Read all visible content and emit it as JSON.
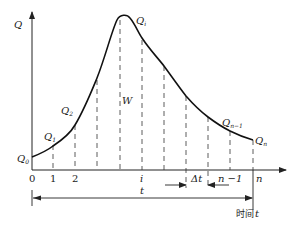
{
  "diagram": {
    "type": "hydrograph",
    "y_axis_label": "Q",
    "x_axis_time_label": "时间",
    "x_axis_time_var": "t",
    "area_label": "W",
    "interval_label": "Δt",
    "total_span_label": "t",
    "curve_labels": [
      {
        "base": "Q",
        "sub": "0"
      },
      {
        "base": "Q",
        "sub": "1"
      },
      {
        "base": "Q",
        "sub": "2"
      },
      {
        "base": "Q",
        "sub": "i"
      },
      {
        "base": "Q",
        "sub": "n−1"
      },
      {
        "base": "Q",
        "sub": "n"
      }
    ],
    "x_ticks": [
      "0",
      "1",
      "2",
      "i",
      "n −1",
      "n"
    ],
    "colors": {
      "line": "#222222",
      "background": "#ffffff"
    }
  }
}
